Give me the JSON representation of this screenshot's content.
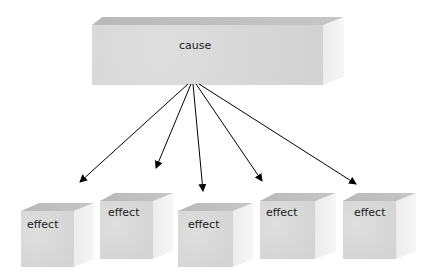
{
  "diagram": {
    "type": "one-to-many",
    "cause": {
      "label": "cause"
    },
    "effects": [
      {
        "label": "effect"
      },
      {
        "label": "effect"
      },
      {
        "label": "effect"
      },
      {
        "label": "effect"
      },
      {
        "label": "effect"
      }
    ],
    "colors": {
      "box_front": "#d6d6d6",
      "box_top": "#bdbdbd",
      "box_side": "#efefef",
      "arrow": "#000000"
    }
  }
}
